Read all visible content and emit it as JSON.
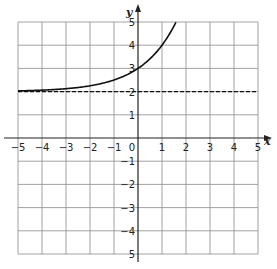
{
  "chart_data": {
    "type": "line",
    "title": "",
    "xlabel": "x",
    "ylabel": "y",
    "xlim": [
      -5,
      5
    ],
    "ylim": [
      -5,
      5
    ],
    "grid": true,
    "x_ticks": [
      "-5",
      "-4",
      "-3",
      "-2",
      "-1",
      "0",
      "1",
      "2",
      "3",
      "4",
      "5"
    ],
    "y_ticks_positive": [
      "1",
      "2",
      "3",
      "4",
      "5"
    ],
    "y_ticks_negative": [
      "-1",
      "-2",
      "-3",
      "-4",
      "5"
    ],
    "series": [
      {
        "name": "exponential curve",
        "style": "solid",
        "x": [
          -5,
          -4,
          -3,
          -2,
          -1,
          0,
          0.5,
          1,
          1.3,
          1.58
        ],
        "y": [
          2.03,
          2.06,
          2.13,
          2.25,
          2.5,
          3,
          3.41,
          4,
          4.46,
          5
        ]
      },
      {
        "name": "horizontal asymptote",
        "style": "dashed",
        "x": [
          -5,
          5
        ],
        "y": [
          2,
          2
        ]
      }
    ],
    "legend": null
  },
  "colors": {
    "curve": "#111111",
    "grid": "#8a8a8a",
    "axis": "#222222"
  }
}
